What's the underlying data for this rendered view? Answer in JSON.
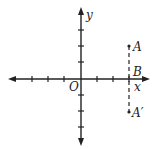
{
  "diagram": {
    "type": "coordinate-plane",
    "axes": {
      "x_label": "x",
      "y_label": "y",
      "origin_label": "O",
      "x_ticks": [
        -3,
        -2,
        -1,
        1,
        2,
        3
      ],
      "y_ticks": [
        -3,
        -2,
        -1,
        1,
        2,
        3
      ]
    },
    "points": [
      {
        "label": "A",
        "x": 3,
        "y": 2
      },
      {
        "label": "B",
        "x": 3,
        "y": 0
      },
      {
        "label": "A′",
        "x": 3,
        "y": -2
      }
    ],
    "segments": [
      {
        "from": "A",
        "to": "A′",
        "style": "dashed"
      }
    ],
    "colors": {
      "ink": "#222222",
      "background": "#ffffff"
    }
  }
}
